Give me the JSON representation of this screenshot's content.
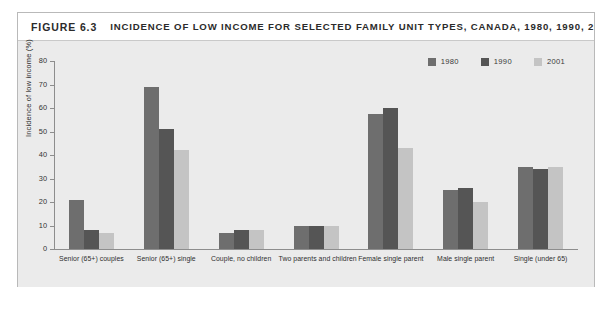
{
  "figure": {
    "number": "FIGURE 6.3",
    "title": "INCIDENCE OF LOW INCOME FOR SELECTED FAMILY UNIT TYPES, CANADA, 1980, 1990, 2001"
  },
  "colors": {
    "series_1980": "#6e6e6e",
    "series_1990": "#555555",
    "series_2001": "#c4c4c4",
    "panel_background": "#ebebeb",
    "frame_border": "#b9b9b9",
    "axis": "#8d8d8d",
    "text": "#2f2f2f"
  },
  "chart_data": {
    "type": "bar",
    "title": "INCIDENCE OF LOW INCOME FOR SELECTED FAMILY UNIT TYPES, CANADA, 1980, 1990, 2001",
    "xlabel": "",
    "ylabel": "Incidence of low income (%)",
    "ylim": [
      0,
      80
    ],
    "yticks": [
      0,
      10,
      20,
      30,
      40,
      50,
      60,
      70,
      80
    ],
    "grid": false,
    "legend_position": "top-right",
    "categories": [
      "Senior (65+) couples",
      "Senior (65+) single",
      "Couple, no children",
      "Two parents and children",
      "Female single parent",
      "Male single parent",
      "Single (under 65)"
    ],
    "series": [
      {
        "name": "1980",
        "color": "#6e6e6e",
        "values": [
          21,
          69,
          7,
          10,
          57.5,
          25,
          35
        ]
      },
      {
        "name": "1990",
        "color": "#555555",
        "values": [
          8,
          51,
          8,
          10,
          60,
          26,
          34
        ]
      },
      {
        "name": "2001",
        "color": "#c4c4c4",
        "values": [
          7,
          42,
          8,
          10,
          43,
          20,
          35
        ]
      }
    ]
  }
}
